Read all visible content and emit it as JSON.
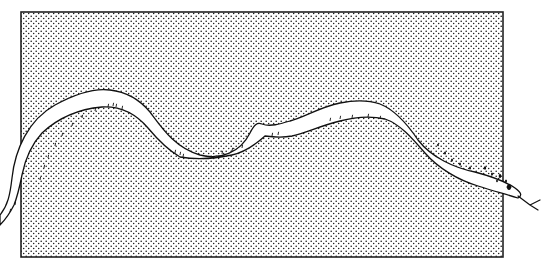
{
  "figure": {
    "caption": "",
    "colors": {
      "background": "#ffffff",
      "stipple": "#1a1a1a",
      "ink": "#111111",
      "snake_fill": "#ffffff"
    },
    "panel": {
      "x": 21,
      "y": 12,
      "width": 482,
      "height": 245,
      "border_width": 1.6
    },
    "snake": {
      "body_path": "M 0 215 C 8 205, 10 195, 12 178 C 15 150, 28 120, 55 105 C 75 94, 95 88, 110 90 C 128 92, 140 100, 150 112 C 162 128, 175 148, 200 155 C 220 160, 240 153, 250 133 C 254 125, 257 122, 262 124 C 270 127, 280 124, 290 121 C 305 117, 320 107, 340 103 C 355 100, 368 100, 380 104 C 395 110, 408 125, 418 140 C 432 158, 455 168, 475 172 C 490 176, 505 181, 515 188 C 522 193, 522 196, 518 198 C 505 194, 490 190, 478 186 C 458 180, 438 168, 425 153 C 412 138, 400 124, 385 119 C 372 116, 355 117, 340 121 C 320 126, 305 133, 292 136 C 282 138, 272 137, 265 136 C 255 145, 245 152, 232 155 C 218 158, 198 160, 180 157 C 168 150, 158 140, 148 128 C 136 114, 120 106, 102 107 C 80 109, 58 118, 42 133 C 30 146, 25 160, 22 175 C 20 185, 18 195, 14 205 C 10 213, 5 220, 0 225 Z",
      "tongue_path": "M 518 196 L 530 205 M 530 205 L 540 200 M 530 205 L 538 210",
      "head_spots": [
        {
          "cx": 485,
          "cy": 168,
          "r": 1.2
        },
        {
          "cx": 492,
          "cy": 174,
          "r": 1.0
        },
        {
          "cx": 500,
          "cy": 176,
          "r": 1.3
        },
        {
          "cx": 506,
          "cy": 181,
          "r": 1.0
        },
        {
          "cx": 497,
          "cy": 181,
          "r": 0.9
        },
        {
          "cx": 509,
          "cy": 187,
          "r": 2.0
        },
        {
          "cx": 452,
          "cy": 160,
          "r": 1.0
        },
        {
          "cx": 460,
          "cy": 164,
          "r": 1.0
        },
        {
          "cx": 438,
          "cy": 145,
          "r": 0.9
        },
        {
          "cx": 445,
          "cy": 153,
          "r": 1.0
        },
        {
          "cx": 470,
          "cy": 168,
          "r": 1.0
        }
      ],
      "scale_ticks": [
        [
          40,
          180
        ],
        [
          44,
          168
        ],
        [
          48,
          158
        ],
        [
          55,
          146
        ],
        [
          62,
          136
        ],
        [
          72,
          126
        ],
        [
          82,
          118
        ],
        [
          95,
          111
        ],
        [
          108,
          107
        ],
        [
          113,
          106
        ],
        [
          116,
          107
        ],
        [
          122,
          109
        ],
        [
          175,
          153
        ],
        [
          180,
          155
        ],
        [
          183,
          157
        ],
        [
          222,
          154
        ],
        [
          232,
          151
        ],
        [
          242,
          148
        ],
        [
          272,
          136
        ],
        [
          278,
          135
        ],
        [
          330,
          121
        ],
        [
          340,
          119
        ],
        [
          352,
          118
        ],
        [
          368,
          117
        ],
        [
          380,
          119
        ],
        [
          15,
          205
        ],
        [
          10,
          212
        ]
      ]
    }
  }
}
